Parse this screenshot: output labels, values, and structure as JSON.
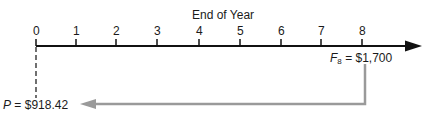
{
  "diagram": {
    "title": "End of Year",
    "ticks": [
      "0",
      "1",
      "2",
      "3",
      "4",
      "5",
      "6",
      "7",
      "8"
    ],
    "future_value": {
      "symbol": "F",
      "subscript": "8",
      "equals": " = ",
      "value": "$1,700"
    },
    "present_value": {
      "symbol": "P",
      "equals": " = ",
      "value": "$918.42"
    },
    "colors": {
      "axis": "#111111",
      "transfer_arrow": "#9a9a9a"
    }
  }
}
